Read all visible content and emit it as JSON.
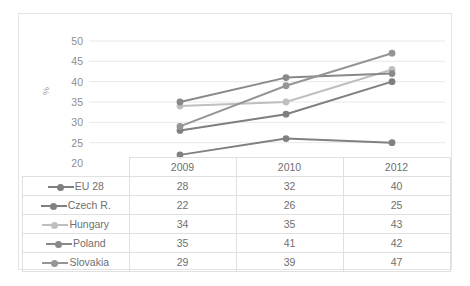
{
  "chart_data": {
    "type": "line",
    "title": "",
    "xlabel": "",
    "ylabel": "%",
    "categories": [
      "2009",
      "2010",
      "2012"
    ],
    "ylim": [
      20,
      50
    ],
    "yticks": [
      50,
      45,
      40,
      35,
      30,
      25,
      20
    ],
    "grid": true,
    "legend_position": "table-left",
    "series": [
      {
        "name": "EU 28",
        "values": [
          28,
          32,
          40
        ],
        "color": "#7f7f7f"
      },
      {
        "name": "Czech R.",
        "values": [
          22,
          26,
          25
        ],
        "color": "#808080"
      },
      {
        "name": "Hungary",
        "values": [
          34,
          35,
          43
        ],
        "color": "#bfbfbf"
      },
      {
        "name": "Poland",
        "values": [
          35,
          41,
          42
        ],
        "color": "#898989"
      },
      {
        "name": "Slovakia",
        "values": [
          29,
          39,
          47
        ],
        "color": "#959595"
      }
    ]
  },
  "table": {
    "header_corner": "",
    "columns": [
      "2009",
      "2010",
      "2012"
    ],
    "rows": [
      {
        "label": "EU 28",
        "values": [
          "28",
          "32",
          "40"
        ]
      },
      {
        "label": "Czech R.",
        "values": [
          "22",
          "26",
          "25"
        ]
      },
      {
        "label": "Hungary",
        "values": [
          "34",
          "35",
          "43"
        ]
      },
      {
        "label": "Poland",
        "values": [
          "35",
          "41",
          "42"
        ]
      },
      {
        "label": "Slovakia",
        "values": [
          "29",
          "39",
          "47"
        ]
      }
    ]
  },
  "axis": {
    "y_title": "%",
    "ticks": [
      "50",
      "45",
      "40",
      "35",
      "30",
      "25",
      "20"
    ]
  },
  "colors": {
    "grid": "#e8e8e8",
    "border": "#e3e3e3",
    "text": "#8d8d8d"
  }
}
